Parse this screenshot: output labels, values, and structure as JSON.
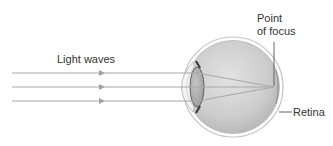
{
  "labels": {
    "light_waves": "Light waves",
    "point_of_focus_line1": "Point",
    "point_of_focus_line2": "of focus",
    "retina": "Retina"
  },
  "colors": {
    "ray": "#a9a9a9",
    "eyeball_fill": "#c8c8c8",
    "sclera_outline": "#bdbdbd",
    "lens_fill": "#b0b0b0",
    "iris": "#4a4a4a",
    "text": "#333333"
  }
}
